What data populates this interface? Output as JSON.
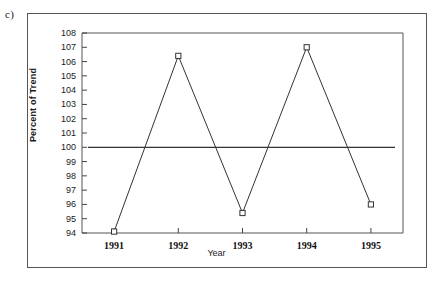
{
  "panel": {
    "label": "c)"
  },
  "chart_data": {
    "type": "line",
    "title": "",
    "subtitle": "",
    "xlabel": "Year",
    "ylabel": "Percent of Trend",
    "categories": [
      "1991",
      "1992",
      "1993",
      "1994",
      "1995"
    ],
    "x": [
      1991,
      1992,
      1993,
      1994,
      1995
    ],
    "values": [
      94.1,
      106.4,
      95.4,
      107.0,
      96.0
    ],
    "series": [
      {
        "name": "Percent of Trend",
        "values": [
          94.1,
          106.4,
          95.4,
          107.0,
          96.0
        ],
        "marker": "open-square",
        "color": "#333333"
      }
    ],
    "reference_line": {
      "name": "Trend (100%)",
      "value": 100,
      "orientation": "horizontal",
      "color": "#333333"
    },
    "ylim": [
      94,
      108
    ],
    "xlim": [
      1990.5,
      1995.5
    ],
    "ytick_labels": [
      "94",
      "95",
      "96",
      "97",
      "98",
      "99",
      "100",
      "101",
      "102",
      "103",
      "104",
      "105",
      "106",
      "107",
      "108"
    ],
    "yticks": [
      94,
      95,
      96,
      97,
      98,
      99,
      100,
      101,
      102,
      103,
      104,
      105,
      106,
      107,
      108
    ],
    "xtick_labels": [
      "1991",
      "1992",
      "1993",
      "1994",
      "1995"
    ],
    "grid": false,
    "legend": "none",
    "annotations": [
      "c)"
    ]
  },
  "colors": {
    "line": "#333333",
    "axis": "#444444",
    "frame": "#555555",
    "background": "#ffffff"
  }
}
